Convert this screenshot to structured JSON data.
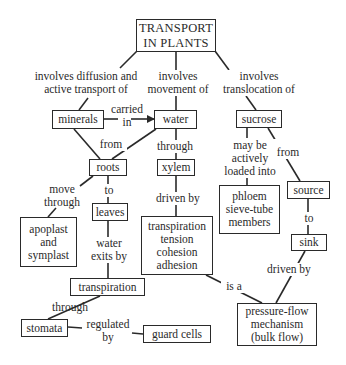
{
  "diagram": {
    "type": "concept-map",
    "title": "TRANSPORT\nIN PLANTS",
    "nodes": {
      "title": {
        "text": "TRANSPORT\nIN PLANTS",
        "x": 136,
        "y": 19,
        "w": 80,
        "h": 33
      },
      "minerals": {
        "text": "minerals",
        "x": 52,
        "y": 110,
        "w": 52,
        "h": 19
      },
      "water": {
        "text": "water",
        "x": 154,
        "y": 110,
        "w": 43,
        "h": 19
      },
      "sucrose": {
        "text": "sucrose",
        "x": 236,
        "y": 110,
        "w": 46,
        "h": 18
      },
      "roots": {
        "text": "roots",
        "x": 89,
        "y": 159,
        "w": 38,
        "h": 17
      },
      "xylem": {
        "text": "xylem",
        "x": 157,
        "y": 159,
        "w": 38,
        "h": 17
      },
      "source": {
        "text": "source",
        "x": 287,
        "y": 181,
        "w": 43,
        "h": 18
      },
      "phloem": {
        "text": "phloem\nsieve-tube\nmembers",
        "x": 219,
        "y": 185,
        "w": 61,
        "h": 49
      },
      "leaves": {
        "text": "leaves",
        "x": 93,
        "y": 203,
        "w": 35,
        "h": 18
      },
      "apoplast": {
        "text": "apoplast\nand\nsymplast",
        "x": 20,
        "y": 217,
        "w": 57,
        "h": 50
      },
      "tension": {
        "text": "transpiration\ntension\ncohesion\nadhesion",
        "x": 141,
        "y": 216,
        "w": 72,
        "h": 59
      },
      "sink": {
        "text": "sink",
        "x": 291,
        "y": 234,
        "w": 36,
        "h": 17
      },
      "transpiration": {
        "text": "transpiration",
        "x": 70,
        "y": 278,
        "w": 75,
        "h": 18
      },
      "pressure": {
        "text": "pressure-flow\nmechanism\n(bulk flow)",
        "x": 237,
        "y": 303,
        "w": 80,
        "h": 43
      },
      "stomata": {
        "text": "stomata",
        "x": 21,
        "y": 319,
        "w": 47,
        "h": 18
      },
      "guard_cells": {
        "text": "guard cells",
        "x": 143,
        "y": 325,
        "w": 68,
        "h": 18
      }
    },
    "link_labels": {
      "diffusion": {
        "text": "involves diffusion and\nactive transport of",
        "x": 26,
        "y": 72,
        "w": 118
      },
      "movement": {
        "text": "involves\nmovement of",
        "x": 144,
        "y": 72,
        "w": 66
      },
      "translocation": {
        "text": "involves\ntranslocation of",
        "x": 212,
        "y": 72,
        "w": 90
      },
      "carried_in": {
        "text": "carried\nin",
        "x": 107,
        "y": 103,
        "w": 40
      },
      "from_roots": {
        "text": "from",
        "x": 96,
        "y": 140,
        "w": 30
      },
      "through_xylem": {
        "text": "through",
        "x": 150,
        "y": 140,
        "w": 44
      },
      "loaded_into": {
        "text": "may be\nactively\nloaded into",
        "x": 220,
        "y": 138,
        "w": 60
      },
      "from_source": {
        "text": "from",
        "x": 273,
        "y": 146,
        "w": 28
      },
      "move_through": {
        "text": "move\nthrough",
        "x": 40,
        "y": 183,
        "w": 44
      },
      "to_leaves": {
        "text": "to",
        "x": 100,
        "y": 184,
        "w": 14
      },
      "driven_by_1": {
        "text": "driven by",
        "x": 148,
        "y": 190,
        "w": 58
      },
      "to_sink": {
        "text": "to",
        "x": 300,
        "y": 214,
        "w": 14
      },
      "water_exits": {
        "text": "water\nexits by",
        "x": 85,
        "y": 238,
        "w": 50
      },
      "driven_by_2": {
        "text": "driven by",
        "x": 260,
        "y": 264,
        "w": 56
      },
      "is_a": {
        "text": "is a",
        "x": 221,
        "y": 280,
        "w": 24
      },
      "through_stomata": {
        "text": "through",
        "x": 47,
        "y": 302,
        "w": 44
      },
      "regulated_by": {
        "text": "regulated\nby",
        "x": 82,
        "y": 319,
        "w": 52
      }
    },
    "colors": {
      "line": "#2a2a2a",
      "background": "#ffffff",
      "text": "#2a2a2a"
    }
  }
}
